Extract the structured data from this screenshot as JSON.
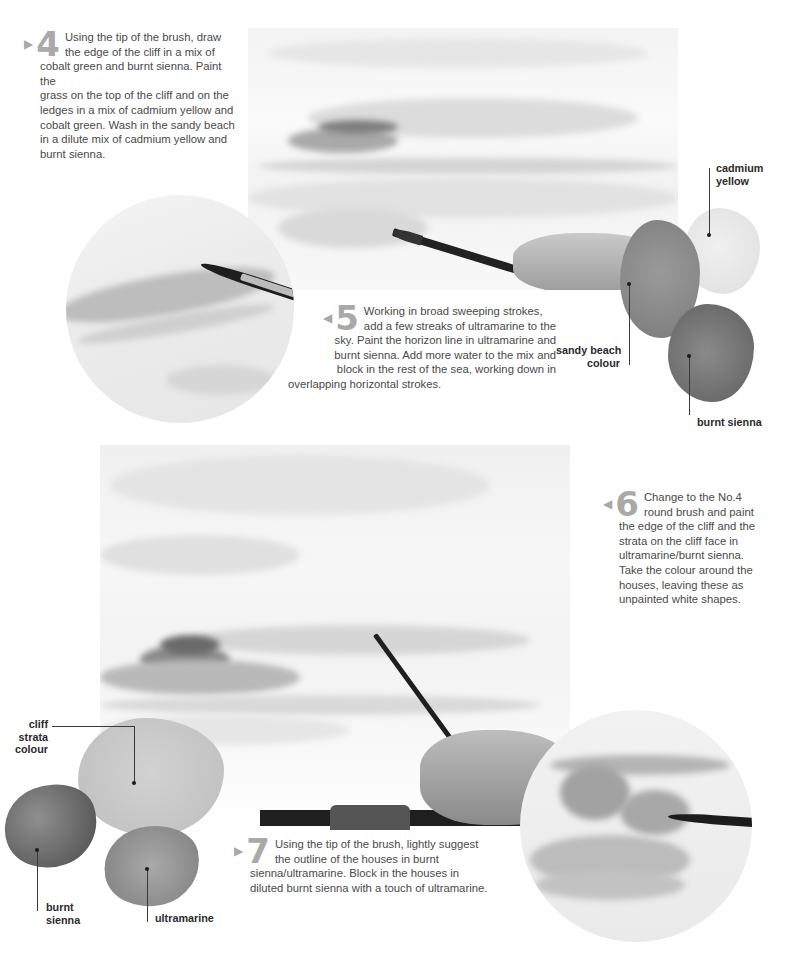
{
  "steps": [
    {
      "id": "step-4",
      "arrow": "▶",
      "number": "4",
      "lines_first": [
        "Using the tip of the brush, draw",
        "the edge of the cliff in a mix of"
      ],
      "lines_rest": [
        "cobalt green and burnt sienna. Paint the",
        "grass on the top of the cliff and on the",
        "ledges in a mix of cadmium yellow and",
        "cobalt green. Wash in the sandy beach",
        "in a dilute mix of cadmium yellow and",
        "burnt sienna."
      ]
    },
    {
      "id": "step-5",
      "arrow": "◀",
      "number": "5",
      "lines_first": [
        "Working in broad sweeping strokes,",
        "add a few streaks of ultramarine to the"
      ],
      "lines_rest": [
        "sky. Paint the horizon line in ultramarine and",
        "burnt sienna. Add more water to the mix and",
        "block in the rest of the sea, working down in",
        "overlapping horizontal strokes."
      ]
    },
    {
      "id": "step-6",
      "arrow": "◀",
      "number": "6",
      "lines_first": [
        "Change to the No.4",
        "round brush and paint"
      ],
      "lines_rest": [
        "the edge of the cliff and the",
        "strata on the cliff face in",
        "ultramarine/burnt sienna.",
        "Take the colour around the",
        "houses, leaving these as",
        "unpainted white shapes."
      ]
    },
    {
      "id": "step-7",
      "arrow": "▶",
      "number": "7",
      "lines_first": [
        "Using the tip of the brush, lightly suggest",
        "the outline of the houses in burnt"
      ],
      "lines_rest": [
        "sienna/ultramarine. Block in the houses in",
        "diluted burnt sienna with a touch of ultramarine."
      ]
    }
  ],
  "swatch_labels_top": {
    "cadmium_yellow": [
      "cadmium",
      "yellow"
    ],
    "sandy_beach": [
      "sandy beach",
      "colour"
    ],
    "burnt_sienna": [
      "burnt sienna"
    ]
  },
  "swatch_labels_bottom": {
    "cliff_strata": [
      "cliff",
      "strata",
      "colour"
    ],
    "burnt_sienna": [
      "burnt",
      "sienna"
    ],
    "ultramarine": [
      "ultramarine"
    ]
  },
  "colors": {
    "text": "#4a4a4a",
    "step_number": "#a9a9a9",
    "label": "#2b2b2b",
    "paper": "#f6f6f6"
  }
}
